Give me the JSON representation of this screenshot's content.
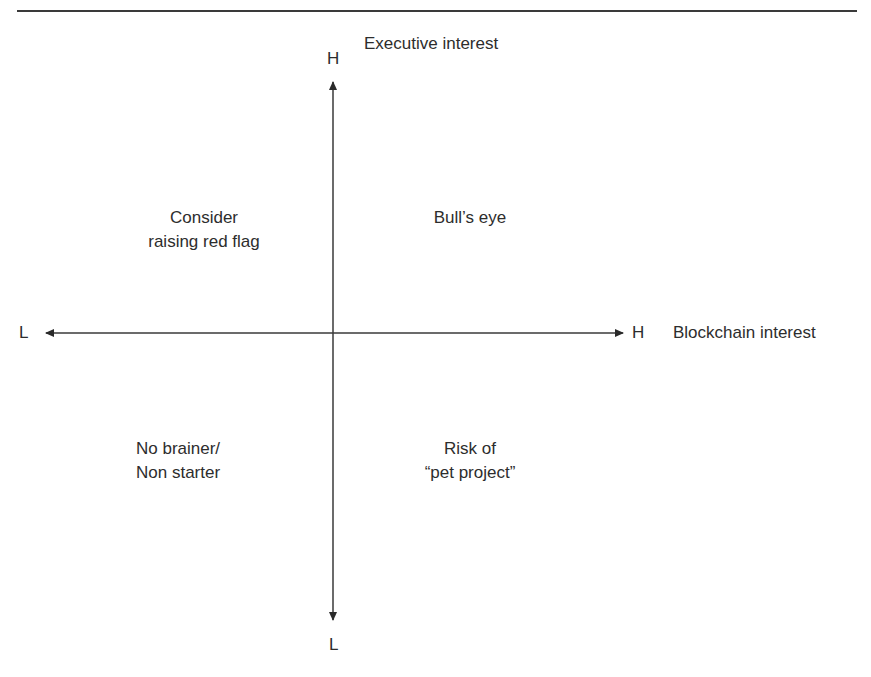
{
  "header": {
    "title_cropped": "Figure: Assessing organizational interest in blockchain"
  },
  "axes": {
    "vertical": {
      "name": "Executive interest",
      "high_label": "H",
      "low_label": "L"
    },
    "horizontal": {
      "name": "Blockchain interest",
      "high_label": "H",
      "low_label": "L"
    }
  },
  "quadrants": {
    "top_left": {
      "line1": "Consider",
      "line2": "raising red flag"
    },
    "top_right": {
      "line1": "Bull’s eye"
    },
    "bottom_left": {
      "line1": "No brainer/",
      "line2": "Non starter"
    },
    "bottom_right": {
      "line1": "Risk of",
      "line2": "“pet project”"
    }
  },
  "colors": {
    "line": "#3a3a3a",
    "text": "#2d2d2d"
  }
}
